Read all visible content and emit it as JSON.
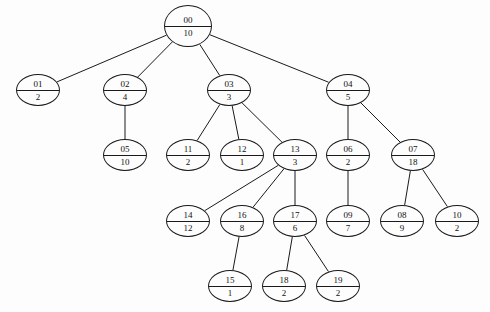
{
  "diagram": {
    "background_color": "#fdfdfd",
    "stroke_color": "#1a1a1a",
    "text_color": "#111111",
    "width": 490,
    "height": 312,
    "node_radius_x": 24,
    "node_radius_y": 21
  },
  "nodes": [
    {
      "key": "n00",
      "id": "00",
      "value": "10",
      "cx": 188,
      "cy": 26,
      "rx": 24,
      "ry": 21
    },
    {
      "key": "n01",
      "id": "01",
      "value": "2",
      "cx": 38,
      "cy": 90,
      "rx": 22,
      "ry": 16
    },
    {
      "key": "n02",
      "id": "02",
      "value": "4",
      "cx": 125,
      "cy": 90,
      "rx": 22,
      "ry": 16
    },
    {
      "key": "n03",
      "id": "03",
      "value": "3",
      "cx": 229,
      "cy": 90,
      "rx": 22,
      "ry": 16
    },
    {
      "key": "n04",
      "id": "04",
      "value": "5",
      "cx": 348,
      "cy": 90,
      "rx": 22,
      "ry": 16
    },
    {
      "key": "n05",
      "id": "05",
      "value": "10",
      "cx": 125,
      "cy": 155,
      "rx": 22,
      "ry": 16
    },
    {
      "key": "n11",
      "id": "11",
      "value": "2",
      "cx": 188,
      "cy": 155,
      "rx": 22,
      "ry": 16
    },
    {
      "key": "n12",
      "id": "12",
      "value": "1",
      "cx": 242,
      "cy": 155,
      "rx": 22,
      "ry": 16
    },
    {
      "key": "n13",
      "id": "13",
      "value": "3",
      "cx": 295,
      "cy": 155,
      "rx": 22,
      "ry": 16
    },
    {
      "key": "n06",
      "id": "06",
      "value": "2",
      "cx": 348,
      "cy": 155,
      "rx": 22,
      "ry": 16
    },
    {
      "key": "n07",
      "id": "07",
      "value": "18",
      "cx": 413,
      "cy": 155,
      "rx": 22,
      "ry": 16
    },
    {
      "key": "n14",
      "id": "14",
      "value": "12",
      "cx": 188,
      "cy": 221,
      "rx": 22,
      "ry": 16
    },
    {
      "key": "n16",
      "id": "16",
      "value": "8",
      "cx": 242,
      "cy": 221,
      "rx": 22,
      "ry": 16
    },
    {
      "key": "n17",
      "id": "17",
      "value": "6",
      "cx": 295,
      "cy": 221,
      "rx": 22,
      "ry": 16
    },
    {
      "key": "n09",
      "id": "09",
      "value": "7",
      "cx": 348,
      "cy": 221,
      "rx": 22,
      "ry": 16
    },
    {
      "key": "n08",
      "id": "08",
      "value": "9",
      "cx": 402,
      "cy": 221,
      "rx": 22,
      "ry": 16
    },
    {
      "key": "n10",
      "id": "10",
      "value": "2",
      "cx": 457,
      "cy": 221,
      "rx": 22,
      "ry": 16
    },
    {
      "key": "n15",
      "id": "15",
      "value": "1",
      "cx": 230,
      "cy": 286,
      "rx": 22,
      "ry": 16
    },
    {
      "key": "n18",
      "id": "18",
      "value": "2",
      "cx": 284,
      "cy": 286,
      "rx": 22,
      "ry": 16
    },
    {
      "key": "n19",
      "id": "19",
      "value": "2",
      "cx": 338,
      "cy": 286,
      "rx": 22,
      "ry": 16
    }
  ],
  "edges": [
    {
      "from": "n00",
      "to": "n01"
    },
    {
      "from": "n00",
      "to": "n02"
    },
    {
      "from": "n00",
      "to": "n03"
    },
    {
      "from": "n00",
      "to": "n04"
    },
    {
      "from": "n02",
      "to": "n05"
    },
    {
      "from": "n03",
      "to": "n11"
    },
    {
      "from": "n03",
      "to": "n12"
    },
    {
      "from": "n03",
      "to": "n13"
    },
    {
      "from": "n04",
      "to": "n06"
    },
    {
      "from": "n04",
      "to": "n07"
    },
    {
      "from": "n13",
      "to": "n14"
    },
    {
      "from": "n13",
      "to": "n16"
    },
    {
      "from": "n13",
      "to": "n17"
    },
    {
      "from": "n06",
      "to": "n09"
    },
    {
      "from": "n07",
      "to": "n08"
    },
    {
      "from": "n07",
      "to": "n10"
    },
    {
      "from": "n16",
      "to": "n15"
    },
    {
      "from": "n17",
      "to": "n18"
    },
    {
      "from": "n17",
      "to": "n19"
    }
  ]
}
